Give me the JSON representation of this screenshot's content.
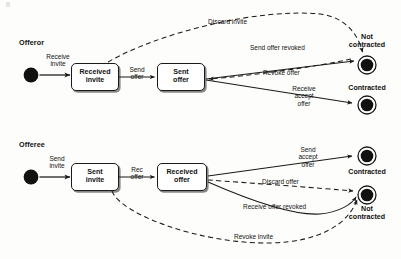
{
  "diagram": {
    "type": "uml-state-machine",
    "title_visible": false,
    "lanes": [
      {
        "id": "offeror",
        "label": "Offeror"
      },
      {
        "id": "offeree",
        "label": "Offeree"
      }
    ],
    "colors": {
      "stroke": "#1a1a1a",
      "box_fill": "#ffffff",
      "node_fill": "#111111",
      "background": "#fdfdfb",
      "shadow": "#585858"
    },
    "offeror": {
      "lane_label": "Offeror",
      "initial_node": "initial-state",
      "states": [
        {
          "id": "received-invite",
          "line1": "Received",
          "line2": "invite"
        },
        {
          "id": "sent-offer",
          "line1": "Sent",
          "line2": "offer"
        }
      ],
      "final_states": [
        {
          "id": "not-contracted",
          "caption_line1": "Not",
          "caption_line2": "contracted"
        },
        {
          "id": "contracted",
          "caption_line1": "Contracted",
          "caption_line2": ""
        }
      ],
      "transitions": [
        {
          "id": "receive-invite",
          "label": "Receive invite",
          "label_line1": "Receive",
          "label_line2": "invite",
          "style": "solid",
          "from": "initial",
          "to": "received-invite"
        },
        {
          "id": "send-offer",
          "label": "Send offer",
          "label_line1": "Send",
          "label_line2": "offer",
          "style": "solid",
          "from": "received-invite",
          "to": "sent-offer"
        },
        {
          "id": "discard-invite",
          "label": "Discard invite",
          "label_line1": "Discard invite",
          "label_line2": "",
          "style": "dashed",
          "from": "received-invite",
          "to": "not-contracted"
        },
        {
          "id": "send-offer-revoked",
          "label": "Send offer revoked",
          "label_line1": "Send offer revoked",
          "label_line2": "",
          "style": "solid",
          "from": "sent-offer",
          "to": "not-contracted"
        },
        {
          "id": "revoke-offer",
          "label": "Revoke offer",
          "label_line1": "Revoke offer",
          "label_line2": "",
          "style": "dashed",
          "from": "sent-offer",
          "to": "not-contracted"
        },
        {
          "id": "receive-accept-offer",
          "label": "Receive accept offer",
          "label_line1": "Receive",
          "label_line2": "accept",
          "label_line3": "offer",
          "style": "solid",
          "from": "sent-offer",
          "to": "contracted"
        }
      ]
    },
    "offeree": {
      "lane_label": "Offeree",
      "initial_node": "initial-state",
      "states": [
        {
          "id": "sent-invite",
          "line1": "Sent",
          "line2": "invite"
        },
        {
          "id": "received-offer",
          "line1": "Received",
          "line2": "offer"
        }
      ],
      "final_states": [
        {
          "id": "contracted",
          "caption_line1": "Contracted",
          "caption_line2": ""
        },
        {
          "id": "not-contracted",
          "caption_line1": "Not",
          "caption_line2": "contracted"
        }
      ],
      "transitions": [
        {
          "id": "send-invite",
          "label": "Send invite",
          "label_line1": "Send",
          "label_line2": "invite",
          "style": "solid",
          "from": "initial",
          "to": "sent-invite"
        },
        {
          "id": "rec-offer",
          "label": "Rec offer",
          "label_line1": "Rec",
          "label_line2": "offer",
          "style": "solid",
          "from": "sent-invite",
          "to": "received-offer"
        },
        {
          "id": "send-accept-offer",
          "label": "Send accept offer",
          "label_line1": "Send",
          "label_line2": "accept",
          "label_line3": "offer",
          "style": "solid",
          "from": "received-offer",
          "to": "contracted"
        },
        {
          "id": "discard-offer",
          "label": "Discard offer",
          "label_line1": "Discard offer",
          "label_line2": "",
          "style": "dashed",
          "from": "received-offer",
          "to": "not-contracted"
        },
        {
          "id": "receive-offer-revoked",
          "label": "Receive offer revoked",
          "label_line1": "Receive offer revoked",
          "label_line2": "",
          "style": "solid",
          "from": "received-offer",
          "to": "not-contracted"
        },
        {
          "id": "revoke-invite",
          "label": "Revoke invite",
          "label_line1": "Revoke invite",
          "label_line2": "",
          "style": "dashed",
          "from": "sent-invite",
          "to": "not-contracted"
        }
      ]
    }
  }
}
